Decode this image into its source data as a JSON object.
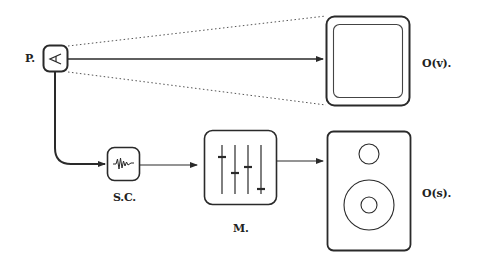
{
  "diagram": {
    "nodes": {
      "perceiver": {
        "label": "P.",
        "icon": "eye-triangle-icon"
      },
      "sound_card": {
        "label": "S.C.",
        "icon": "waveform-icon"
      },
      "mixer": {
        "label": "M.",
        "icon": "mixer-sliders-icon"
      },
      "visual_output": {
        "label": "O(v).",
        "icon": "monitor-screen-icon"
      },
      "sound_output": {
        "label": "O(s).",
        "icon": "speaker-icon"
      }
    },
    "edges": [
      {
        "from": "P.",
        "to": "O(v).",
        "style": "solid-arrow"
      },
      {
        "from": "P.",
        "to": "O(v).",
        "style": "dotted-view-cone"
      },
      {
        "from": "P.",
        "to": "S.C.",
        "style": "curved-solid-arrow"
      },
      {
        "from": "S.C.",
        "to": "M.",
        "style": "solid-arrow"
      },
      {
        "from": "M.",
        "to": "O(s).",
        "style": "solid-arrow"
      }
    ],
    "colors": {
      "stroke": "#2a2a2a",
      "background": "#ffffff"
    }
  }
}
